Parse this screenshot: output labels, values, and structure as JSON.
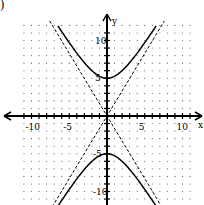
{
  "label": ")",
  "chart_data": {
    "type": "line",
    "title": "",
    "equation": "y^2/25 - x^2/9 = 1",
    "xlabel": "x",
    "ylabel": "y",
    "xlim": [
      -12,
      12
    ],
    "ylim": [
      -12,
      12
    ],
    "x_ticks": [
      -10,
      -5,
      5,
      10
    ],
    "y_ticks": [
      10,
      5,
      -5,
      -10
    ],
    "x_tick_labels": [
      "-10",
      "-5",
      "5",
      "10"
    ],
    "y_tick_labels": [
      "10",
      "5",
      "-5",
      "-10"
    ],
    "grid": "dotted",
    "series": [
      {
        "name": "hyperbola upper branch",
        "style": "solid",
        "vertex": [
          0,
          5
        ]
      },
      {
        "name": "hyperbola lower branch",
        "style": "solid",
        "vertex": [
          0,
          -5
        ]
      },
      {
        "name": "asymptote y = 5/3 x",
        "style": "dashed"
      },
      {
        "name": "asymptote y = -5/3 x",
        "style": "dashed"
      }
    ]
  }
}
